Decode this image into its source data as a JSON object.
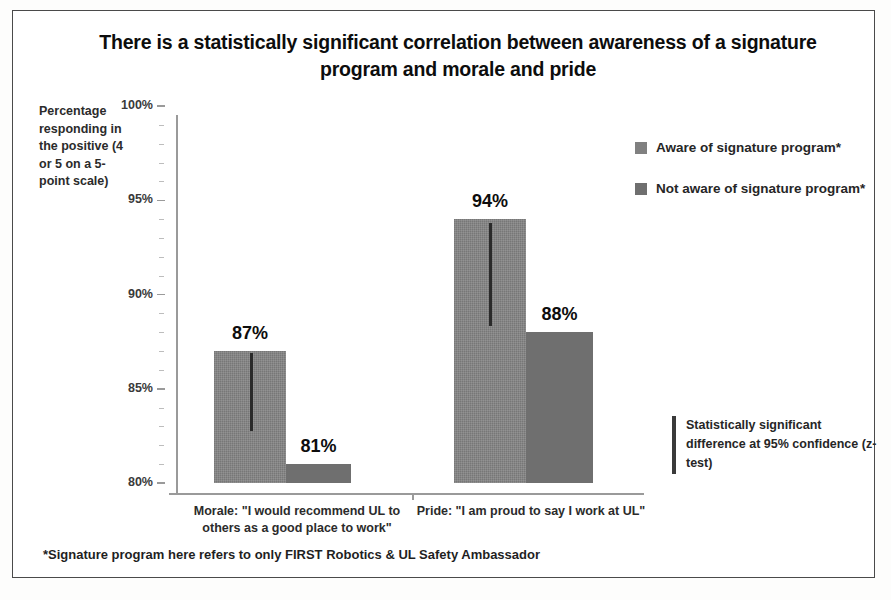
{
  "chart_data": {
    "type": "bar",
    "title": "There is a statistically significant correlation between awareness of a signature program and morale and pride",
    "xlabel": "",
    "ylabel": "Percentage responding in the positive (4 or 5 on a 5-point scale)",
    "ylim": [
      80,
      100
    ],
    "ytick_labels": [
      "100%",
      "95%",
      "90%",
      "85%",
      "80%"
    ],
    "ytick_values": [
      100,
      95,
      90,
      85,
      80
    ],
    "grid": false,
    "legend_position": "right",
    "categories": [
      "Morale: \"I would recommend UL to others as a good place to work\"",
      "Pride: \"I am proud to say I work at UL\""
    ],
    "series": [
      {
        "name": "Aware of signature program*",
        "color": "#808080",
        "values": [
          87,
          94
        ],
        "data_labels": [
          "87%",
          "94%"
        ],
        "error_bars": [
          true,
          true
        ]
      },
      {
        "name": "Not aware of signature program*",
        "color": "#6f6f6f",
        "values": [
          81,
          88
        ],
        "data_labels": [
          "81%",
          "88%"
        ],
        "error_bars": [
          false,
          false
        ]
      }
    ],
    "annotations": [
      "Statistically significant difference at 95% confidence (z-test)"
    ],
    "footnote": "*Signature program here refers to only FIRST Robotics & UL Safety Ambassador"
  },
  "title": {
    "text": "There is a statistically significant correlation between awareness of a signature program and morale and pride"
  },
  "axis": {
    "y_caption": "Percentage responding in the positive (4 or 5 on a 5-point scale)",
    "ticks": [
      {
        "label": "100%",
        "value": 100
      },
      {
        "label": "95%",
        "value": 95
      },
      {
        "label": "90%",
        "value": 90
      },
      {
        "label": "85%",
        "value": 85
      },
      {
        "label": "80%",
        "value": 80
      }
    ]
  },
  "categories": [
    {
      "label": "Morale: \"I would recommend UL to others as a good place to work\""
    },
    {
      "label": "Pride: \"I am proud to say I work at UL\""
    }
  ],
  "bars": [
    {
      "label": "87%",
      "value": 87,
      "series": "Aware of signature program*"
    },
    {
      "label": "81%",
      "value": 81,
      "series": "Not aware of signature program*"
    },
    {
      "label": "94%",
      "value": 94,
      "series": "Aware of signature program*"
    },
    {
      "label": "88%",
      "value": 88,
      "series": "Not aware of signature program*"
    }
  ],
  "legend": {
    "items": [
      {
        "label": "Aware of signature program*",
        "color": "#808080"
      },
      {
        "label": "Not aware of signature program*",
        "color": "#6f6f6f"
      }
    ]
  },
  "annotation": {
    "text": "Statistically significant difference at 95% confidence (z-test)"
  },
  "footnote": {
    "text": "*Signature program here refers to only FIRST Robotics & UL Safety Ambassador"
  },
  "colors": {
    "bar_light": "#808080",
    "bar_dark": "#6f6f6f",
    "axis": "#9a9a9a",
    "text": "#111111",
    "frame": "#4a4a4a"
  }
}
